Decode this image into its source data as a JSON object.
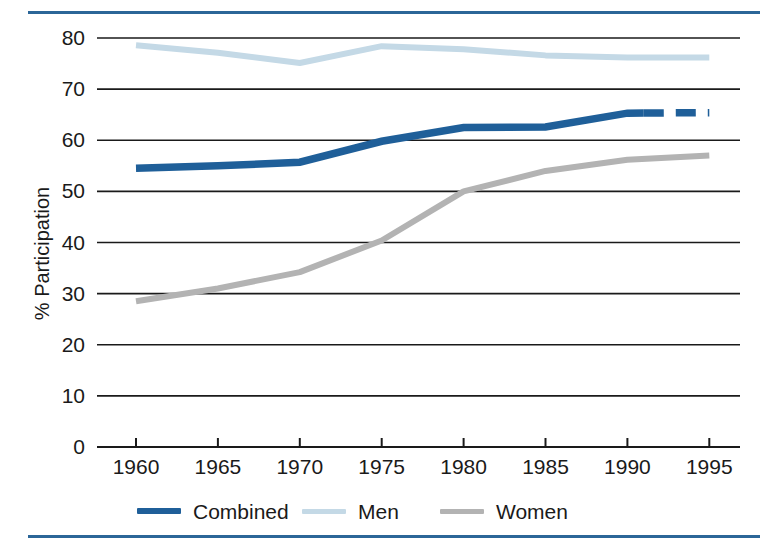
{
  "chart_data": {
    "type": "line",
    "title": "",
    "xlabel": "",
    "ylabel": "% Participation",
    "xlim": [
      1960,
      1995
    ],
    "ylim": [
      0,
      80
    ],
    "grid": true,
    "legend_position": "bottom",
    "x_ticks": [
      "1960",
      "1965",
      "1970",
      "1975",
      "1980",
      "1985",
      "1990",
      "1995"
    ],
    "y_ticks": [
      "0",
      "10",
      "20",
      "30",
      "40",
      "50",
      "60",
      "70",
      "80"
    ],
    "x": [
      1960,
      1965,
      1970,
      1975,
      1980,
      1985,
      1990,
      1995
    ],
    "series": [
      {
        "name": "Combined",
        "color": "#1f5f99",
        "style": "solid-then-dashed",
        "dashed_from": 1991,
        "values": [
          54.5,
          55.0,
          55.7,
          59.8,
          62.5,
          62.6,
          65.3,
          65.4
        ]
      },
      {
        "name": "Men",
        "color": "#c4d9e6",
        "style": "solid",
        "values": [
          78.6,
          77.1,
          75.1,
          78.4,
          77.8,
          76.6,
          76.2,
          76.2
        ]
      },
      {
        "name": "Women",
        "color": "#b3b3b3",
        "style": "solid",
        "values": [
          28.5,
          31.0,
          34.2,
          40.4,
          50.0,
          54.0,
          56.2,
          57.0
        ]
      }
    ]
  },
  "axis": {
    "y_label": "% Participation"
  },
  "legend": {
    "items": [
      {
        "label": "Combined",
        "color": "#1f5f99"
      },
      {
        "label": "Men",
        "color": "#c4d9e6"
      },
      {
        "label": "Women",
        "color": "#b3b3b3"
      }
    ]
  }
}
